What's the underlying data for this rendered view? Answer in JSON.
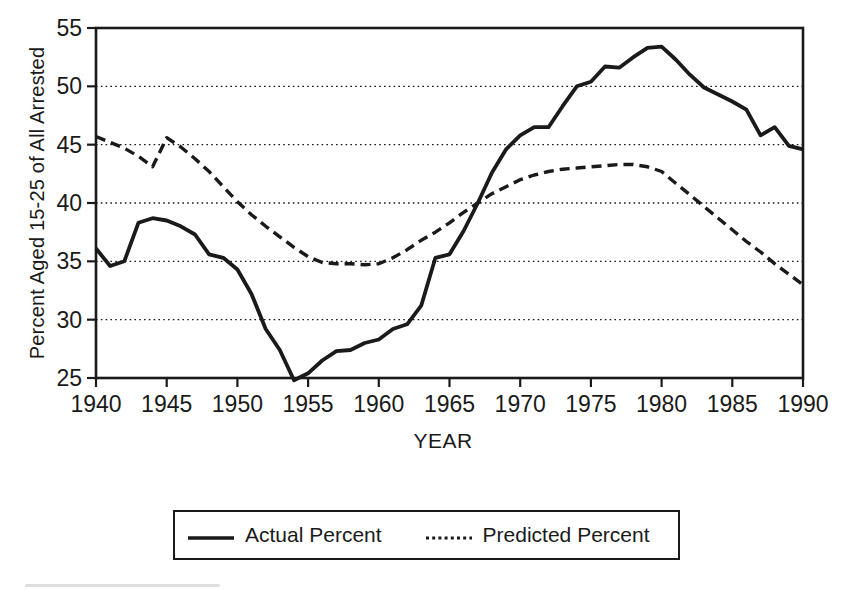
{
  "page": {
    "background": "#ffffff",
    "ink_color": "#1a1a1a"
  },
  "chart_data": {
    "type": "line",
    "title": "",
    "xlabel": "YEAR",
    "ylabel": "Percent Aged 15-25 of All Arrested",
    "xlim": [
      1940,
      1990
    ],
    "ylim": [
      25,
      55
    ],
    "x_ticks": [
      1940,
      1945,
      1950,
      1955,
      1960,
      1965,
      1970,
      1975,
      1980,
      1985,
      1990
    ],
    "y_ticks": [
      25,
      30,
      35,
      40,
      45,
      50,
      55
    ],
    "gridline_values": [
      30,
      35,
      40,
      45,
      50
    ],
    "grid": "dotted-horizontal",
    "frame": "full-box",
    "legend_position": "bottom-outside",
    "x": [
      1940,
      1941,
      1942,
      1943,
      1944,
      1945,
      1946,
      1947,
      1948,
      1949,
      1950,
      1951,
      1952,
      1953,
      1954,
      1955,
      1956,
      1957,
      1958,
      1959,
      1960,
      1961,
      1962,
      1963,
      1964,
      1965,
      1966,
      1967,
      1968,
      1969,
      1970,
      1971,
      1972,
      1973,
      1974,
      1975,
      1976,
      1977,
      1978,
      1979,
      1980,
      1981,
      1982,
      1983,
      1984,
      1985,
      1986,
      1987,
      1988,
      1989,
      1990
    ],
    "series": [
      {
        "name": "Actual Percent",
        "style": "solid",
        "color": "#1a1a1a",
        "values": [
          36.1,
          34.6,
          35.0,
          38.3,
          38.7,
          38.5,
          38.0,
          37.3,
          35.6,
          35.3,
          34.3,
          32.2,
          29.2,
          27.4,
          24.8,
          25.4,
          26.5,
          27.3,
          27.4,
          28.0,
          28.3,
          29.2,
          29.6,
          31.2,
          35.3,
          35.6,
          37.6,
          40.0,
          42.6,
          44.6,
          45.8,
          46.5,
          46.5,
          48.3,
          50.0,
          50.4,
          51.7,
          51.6,
          52.5,
          53.3,
          53.4,
          52.3,
          51.0,
          49.9,
          49.3,
          48.7,
          48.0,
          45.8,
          46.5,
          44.9,
          44.6
        ]
      },
      {
        "name": "Predicted Percent",
        "style": "dashed",
        "color": "#1a1a1a",
        "values": [
          45.7,
          45.2,
          44.7,
          44.0,
          43.1,
          45.6,
          44.8,
          43.8,
          42.7,
          41.4,
          40.1,
          39.0,
          38.0,
          37.1,
          36.2,
          35.4,
          34.9,
          34.8,
          34.8,
          34.7,
          34.8,
          35.3,
          36.0,
          36.8,
          37.5,
          38.3,
          39.2,
          40.0,
          40.8,
          41.4,
          42.0,
          42.4,
          42.7,
          42.9,
          43.0,
          43.1,
          43.2,
          43.3,
          43.3,
          43.1,
          42.7,
          41.7,
          40.7,
          39.7,
          38.7,
          37.7,
          36.7,
          35.8,
          34.8,
          33.9,
          33.0
        ]
      }
    ]
  }
}
